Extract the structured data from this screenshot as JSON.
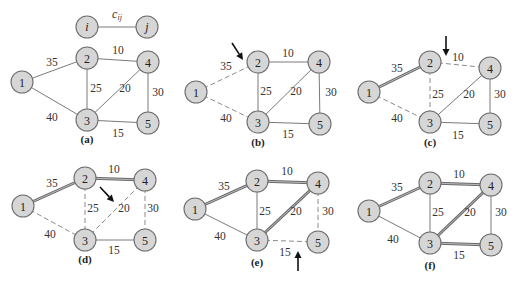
{
  "legend": {
    "node_i": {
      "label": "i",
      "x": 87,
      "y": 27
    },
    "node_j": {
      "label": "j",
      "x": 147,
      "y": 27
    },
    "edge_label": "c",
    "edge_label_sub": "ij",
    "edge_label_pos": {
      "x": 117,
      "y": 14
    }
  },
  "colors": {
    "node_fill": "#d6d6d6",
    "node_stroke": "#6e6e6e",
    "edge": "#7a7a7a",
    "tree_edge": "#6a6a6a",
    "arrow": "#111111"
  },
  "edges": [
    {
      "id": "1-2",
      "from": "1",
      "to": "2",
      "weight": "35"
    },
    {
      "id": "1-3",
      "from": "1",
      "to": "3",
      "weight": "40"
    },
    {
      "id": "2-4",
      "from": "2",
      "to": "4",
      "weight": "10"
    },
    {
      "id": "2-3",
      "from": "2",
      "to": "3",
      "weight": "25"
    },
    {
      "id": "3-4",
      "from": "3",
      "to": "4",
      "weight": "20"
    },
    {
      "id": "4-5",
      "from": "4",
      "to": "5",
      "weight": "30"
    },
    {
      "id": "3-5",
      "from": "3",
      "to": "5",
      "weight": "15"
    }
  ],
  "panels": [
    {
      "caption": "(a)",
      "caption_pos": {
        "x": 87,
        "y": 139
      },
      "nodes": {
        "1": [
          22,
          82
        ],
        "2": [
          87,
          58
        ],
        "3": [
          87,
          120
        ],
        "4": [
          148,
          62
        ],
        "5": [
          148,
          123
        ]
      },
      "labels": {
        "1-2": [
          52,
          62
        ],
        "1-3": [
          52,
          117
        ],
        "2-4": [
          118,
          50
        ],
        "2-3": [
          96,
          88
        ],
        "3-4": [
          125,
          88
        ],
        "4-5": [
          158,
          92
        ],
        "3-5": [
          118,
          133
        ]
      },
      "edge_state": {
        "1-2": "normal",
        "1-3": "normal",
        "2-4": "normal",
        "2-3": "normal",
        "3-4": "normal",
        "4-5": "normal",
        "3-5": "normal"
      },
      "arrow": null
    },
    {
      "caption": "(b)",
      "caption_pos": {
        "x": 258,
        "y": 142
      },
      "nodes": {
        "1": [
          196,
          92
        ],
        "2": [
          258,
          62
        ],
        "3": [
          258,
          122
        ],
        "4": [
          319,
          62
        ],
        "5": [
          320,
          124
        ]
      },
      "labels": {
        "1-2": [
          226,
          66
        ],
        "1-3": [
          226,
          118
        ],
        "2-4": [
          288,
          53
        ],
        "2-3": [
          266,
          91
        ],
        "3-4": [
          296,
          91
        ],
        "4-5": [
          331,
          92
        ],
        "3-5": [
          288,
          134
        ]
      },
      "edge_state": {
        "1-2": "dashed",
        "1-3": "dashed",
        "2-4": "normal",
        "2-3": "normal",
        "3-4": "normal",
        "4-5": "normal",
        "3-5": "normal"
      },
      "arrow": {
        "x1": 232,
        "y1": 43,
        "x2": 243,
        "y2": 60
      }
    },
    {
      "caption": "(c)",
      "caption_pos": {
        "x": 430,
        "y": 142
      },
      "nodes": {
        "1": [
          369,
          92
        ],
        "2": [
          430,
          62
        ],
        "3": [
          430,
          122
        ],
        "4": [
          490,
          68
        ],
        "5": [
          490,
          124
        ]
      },
      "labels": {
        "1-2": [
          397,
          68
        ],
        "1-3": [
          397,
          118
        ],
        "2-4": [
          458,
          57
        ],
        "2-3": [
          438,
          94
        ],
        "3-4": [
          469,
          94
        ],
        "4-5": [
          500,
          94
        ],
        "3-5": [
          458,
          135
        ]
      },
      "edge_state": {
        "1-2": "tree",
        "1-3": "dashed",
        "2-4": "dashed",
        "2-3": "dashed",
        "3-4": "normal",
        "4-5": "normal",
        "3-5": "normal"
      },
      "arrow": {
        "x1": 446,
        "y1": 36,
        "x2": 446,
        "y2": 56
      }
    },
    {
      "caption": "(d)",
      "caption_pos": {
        "x": 85,
        "y": 259
      },
      "nodes": {
        "1": [
          23,
          206
        ],
        "2": [
          85,
          178
        ],
        "3": [
          85,
          240
        ],
        "4": [
          145,
          180
        ],
        "5": [
          145,
          240
        ]
      },
      "labels": {
        "1-2": [
          52,
          183
        ],
        "1-3": [
          50,
          234
        ],
        "2-4": [
          114,
          169
        ],
        "2-3": [
          93,
          208
        ],
        "3-4": [
          124,
          208
        ],
        "4-5": [
          153,
          208
        ],
        "3-5": [
          114,
          250
        ]
      },
      "edge_state": {
        "1-2": "tree",
        "1-3": "dashed",
        "2-4": "tree",
        "2-3": "dashed",
        "3-4": "dashed",
        "4-5": "dashed",
        "3-5": "normal"
      },
      "arrow": {
        "x1": 100,
        "y1": 187,
        "x2": 114,
        "y2": 202
      }
    },
    {
      "caption": "(e)",
      "caption_pos": {
        "x": 257,
        "y": 262
      },
      "nodes": {
        "1": [
          195,
          209
        ],
        "2": [
          257,
          181
        ],
        "3": [
          257,
          240
        ],
        "4": [
          318,
          183
        ],
        "5": [
          318,
          242
        ]
      },
      "labels": {
        "1-2": [
          224,
          186
        ],
        "1-3": [
          220,
          236
        ],
        "2-4": [
          287,
          171
        ],
        "2-3": [
          265,
          211
        ],
        "3-4": [
          296,
          211
        ],
        "4-5": [
          328,
          211
        ],
        "3-5": [
          285,
          252
        ]
      },
      "edge_state": {
        "1-2": "tree",
        "1-3": "normal",
        "2-4": "tree",
        "2-3": "normal",
        "3-4": "tree",
        "4-5": "dashed",
        "3-5": "dashed"
      },
      "arrow": {
        "x1": 298,
        "y1": 271,
        "x2": 298,
        "y2": 251
      }
    },
    {
      "caption": "(f)",
      "caption_pos": {
        "x": 430,
        "y": 265
      },
      "nodes": {
        "1": [
          369,
          211
        ],
        "2": [
          430,
          183
        ],
        "3": [
          430,
          243
        ],
        "4": [
          491,
          185
        ],
        "5": [
          491,
          245
        ]
      },
      "labels": {
        "1-2": [
          397,
          187
        ],
        "1-3": [
          393,
          239
        ],
        "2-4": [
          459,
          174
        ],
        "2-3": [
          438,
          212
        ],
        "3-4": [
          470,
          212
        ],
        "4-5": [
          501,
          212
        ],
        "3-5": [
          459,
          255
        ]
      },
      "edge_state": {
        "1-2": "tree",
        "1-3": "normal",
        "2-4": "tree",
        "2-3": "normal",
        "3-4": "tree",
        "4-5": "normal",
        "3-5": "tree"
      },
      "arrow": null
    }
  ]
}
